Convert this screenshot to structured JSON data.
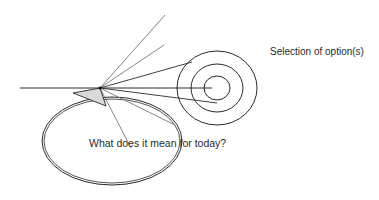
{
  "diagram": {
    "labels": {
      "selection": "Selection of option(s)",
      "question": "What does it mean for today?"
    },
    "colors": {
      "stroke": "#2a2a2a",
      "ray": "#777777",
      "arrow_fill": "#d9d9d9",
      "background": "#ffffff"
    },
    "focal_point": {
      "x": 100,
      "y": 88
    },
    "rays": [
      {
        "x2": 165,
        "y2": 15
      },
      {
        "x2": 164,
        "y2": 45
      },
      {
        "x2": 192,
        "y2": 62
      },
      {
        "x2": 212,
        "y2": 88
      },
      {
        "x2": 217,
        "y2": 103
      },
      {
        "x2": 175,
        "y2": 125
      },
      {
        "x2": 131,
        "y2": 148
      }
    ],
    "target_rings": {
      "cx": 217,
      "cy": 88,
      "rings": [
        {
          "rx": 13,
          "ry": 12
        },
        {
          "rx": 26,
          "ry": 24
        },
        {
          "rx": 40,
          "ry": 37
        }
      ]
    },
    "cycle_loop": {
      "cx": 112,
      "cy": 141,
      "rx": 70,
      "ry": 44
    }
  }
}
